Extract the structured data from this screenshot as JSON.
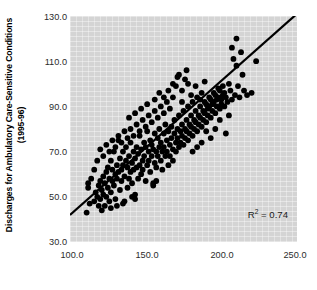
{
  "axes": {
    "ylabel_line1": "Discharges for Ambulatory Care-Sensitive Conditions",
    "ylabel_line2": "(1995-96)",
    "xlabel": "",
    "yticklabels": [
      "130.0",
      "110.0",
      "90.0",
      "70.0",
      "50.0",
      "30.0"
    ],
    "xticklabels": [
      "100.0",
      "150.0",
      "200.0",
      "250.0"
    ]
  },
  "annotation": {
    "r2_prefix": "R",
    "r2_exponent": "2",
    "r2_value": " = 0.74",
    "r2_full": "R2 = 0.74"
  },
  "colors": {
    "plot_background": "#d4d4d4",
    "marker": "#000000",
    "trendline": "#000000",
    "figure_background": "#ffffff",
    "tick_text": "#2b2b2b",
    "axis_title": "#000000"
  },
  "chart_data": {
    "type": "scatter",
    "title": "",
    "xlabel": "",
    "ylabel": "Discharges for Ambulatory Care-Sensitive Conditions (1995-96)",
    "xlim": [
      100.0,
      250.0
    ],
    "ylim": [
      30.0,
      130.0
    ],
    "xticks": [
      100.0,
      150.0,
      200.0,
      250.0
    ],
    "yticks": [
      30.0,
      50.0,
      70.0,
      90.0,
      110.0,
      130.0
    ],
    "grid": false,
    "legend": null,
    "annotations": [
      {
        "text": "R2 = 0.74",
        "x": 232.0,
        "y": 39.0
      }
    ],
    "trendline": {
      "type": "linear",
      "x": [
        100.0,
        250.0
      ],
      "y": [
        42.0,
        131.0
      ],
      "slope": 0.593,
      "intercept": -17.3,
      "r_squared": 0.74
    },
    "marker": {
      "shape": "circle",
      "size": 5,
      "color": "#000000"
    },
    "n_points": 253,
    "points": [
      [
        111,
        43
      ],
      [
        112,
        56
      ],
      [
        113,
        47
      ],
      [
        116,
        48
      ],
      [
        117,
        52
      ],
      [
        118,
        50
      ],
      [
        119,
        46
      ],
      [
        119,
        55
      ],
      [
        120,
        49
      ],
      [
        120,
        57
      ],
      [
        121,
        44
      ],
      [
        121,
        53
      ],
      [
        122,
        51
      ],
      [
        122,
        59
      ],
      [
        123,
        46
      ],
      [
        123,
        56
      ],
      [
        124,
        61
      ],
      [
        124,
        50
      ],
      [
        125,
        54
      ],
      [
        125,
        63
      ],
      [
        126,
        48
      ],
      [
        126,
        58
      ],
      [
        127,
        52
      ],
      [
        127,
        66
      ],
      [
        128,
        57
      ],
      [
        128,
        62
      ],
      [
        129,
        55
      ],
      [
        129,
        70
      ],
      [
        130,
        60
      ],
      [
        130,
        49
      ],
      [
        131,
        64
      ],
      [
        131,
        58
      ],
      [
        132,
        75
      ],
      [
        132,
        61
      ],
      [
        133,
        53
      ],
      [
        133,
        67
      ],
      [
        134,
        62
      ],
      [
        134,
        57
      ],
      [
        135,
        70
      ],
      [
        135,
        64
      ],
      [
        136,
        48
      ],
      [
        136,
        59
      ],
      [
        137,
        66
      ],
      [
        137,
        72
      ],
      [
        138,
        54
      ],
      [
        138,
        63
      ],
      [
        139,
        68
      ],
      [
        139,
        58
      ],
      [
        140,
        61
      ],
      [
        140,
        74
      ],
      [
        141,
        65
      ],
      [
        141,
        56
      ],
      [
        142,
        70
      ],
      [
        142,
        62
      ],
      [
        143,
        49
      ],
      [
        143,
        67
      ],
      [
        144,
        72
      ],
      [
        144,
        63
      ],
      [
        145,
        58
      ],
      [
        145,
        69
      ],
      [
        146,
        64
      ],
      [
        146,
        77
      ],
      [
        147,
        60
      ],
      [
        147,
        71
      ],
      [
        148,
        66
      ],
      [
        148,
        62
      ],
      [
        149,
        74
      ],
      [
        149,
        68
      ],
      [
        150,
        57
      ],
      [
        150,
        72
      ],
      [
        151,
        64
      ],
      [
        151,
        79
      ],
      [
        152,
        70
      ],
      [
        152,
        66
      ],
      [
        153,
        61
      ],
      [
        153,
        75
      ],
      [
        154,
        68
      ],
      [
        154,
        73
      ],
      [
        155,
        55
      ],
      [
        155,
        71
      ],
      [
        156,
        65
      ],
      [
        156,
        78
      ],
      [
        157,
        70
      ],
      [
        157,
        63
      ],
      [
        158,
        76
      ],
      [
        158,
        68
      ],
      [
        159,
        72
      ],
      [
        159,
        80
      ],
      [
        160,
        66
      ],
      [
        160,
        74
      ],
      [
        161,
        70
      ],
      [
        161,
        62
      ],
      [
        162,
        78
      ],
      [
        162,
        72
      ],
      [
        163,
        68
      ],
      [
        163,
        82
      ],
      [
        164,
        75
      ],
      [
        164,
        70
      ],
      [
        165,
        64
      ],
      [
        165,
        79
      ],
      [
        166,
        73
      ],
      [
        166,
        68
      ],
      [
        167,
        81
      ],
      [
        167,
        76
      ],
      [
        168,
        71
      ],
      [
        168,
        66
      ],
      [
        169,
        78
      ],
      [
        169,
        84
      ],
      [
        170,
        74
      ],
      [
        170,
        70
      ],
      [
        171,
        80
      ],
      [
        171,
        76
      ],
      [
        172,
        72
      ],
      [
        172,
        86
      ],
      [
        173,
        79
      ],
      [
        173,
        74
      ],
      [
        174,
        82
      ],
      [
        174,
        77
      ],
      [
        175,
        73
      ],
      [
        175,
        88
      ],
      [
        176,
        80
      ],
      [
        176,
        76
      ],
      [
        177,
        84
      ],
      [
        177,
        79
      ],
      [
        178,
        75
      ],
      [
        178,
        90
      ],
      [
        179,
        82
      ],
      [
        179,
        78
      ],
      [
        180,
        86
      ],
      [
        180,
        81
      ],
      [
        181,
        77
      ],
      [
        181,
        92
      ],
      [
        182,
        84
      ],
      [
        182,
        80
      ],
      [
        183,
        88
      ],
      [
        183,
        83
      ],
      [
        184,
        79
      ],
      [
        184,
        94
      ],
      [
        185,
        86
      ],
      [
        185,
        82
      ],
      [
        186,
        90
      ],
      [
        186,
        85
      ],
      [
        187,
        81
      ],
      [
        187,
        96
      ],
      [
        188,
        88
      ],
      [
        188,
        84
      ],
      [
        189,
        92
      ],
      [
        189,
        87
      ],
      [
        190,
        83
      ],
      [
        190,
        91
      ],
      [
        191,
        89
      ],
      [
        191,
        86
      ],
      [
        192,
        94
      ],
      [
        192,
        90
      ],
      [
        193,
        85
      ],
      [
        193,
        93
      ],
      [
        194,
        91
      ],
      [
        194,
        88
      ],
      [
        195,
        96
      ],
      [
        195,
        92
      ],
      [
        196,
        87
      ],
      [
        196,
        95
      ],
      [
        197,
        93
      ],
      [
        197,
        90
      ],
      [
        198,
        98
      ],
      [
        198,
        94
      ],
      [
        199,
        89
      ],
      [
        199,
        97
      ],
      [
        200,
        93
      ],
      [
        200,
        91
      ],
      [
        201,
        99
      ],
      [
        201,
        95
      ],
      [
        202,
        90
      ],
      [
        202,
        96
      ],
      [
        203,
        94
      ],
      [
        204,
        92
      ],
      [
        205,
        100
      ],
      [
        206,
        97
      ],
      [
        207,
        93
      ],
      [
        208,
        111
      ],
      [
        209,
        95
      ],
      [
        210,
        120
      ],
      [
        210,
        108
      ],
      [
        211,
        99
      ],
      [
        212,
        94
      ],
      [
        213,
        114
      ],
      [
        214,
        104
      ],
      [
        215,
        97
      ],
      [
        217,
        95
      ],
      [
        220,
        96
      ],
      [
        223,
        110
      ],
      [
        207,
        116
      ],
      [
        205,
        86
      ],
      [
        203,
        78
      ],
      [
        199,
        84
      ],
      [
        196,
        80
      ],
      [
        193,
        76
      ],
      [
        190,
        79
      ],
      [
        187,
        74
      ],
      [
        184,
        72
      ],
      [
        181,
        70
      ],
      [
        178,
        100
      ],
      [
        176,
        102
      ],
      [
        174,
        97
      ],
      [
        172,
        104
      ],
      [
        170,
        99
      ],
      [
        168,
        94
      ],
      [
        166,
        89
      ],
      [
        164,
        92
      ],
      [
        162,
        87
      ],
      [
        160,
        90
      ],
      [
        158,
        85
      ],
      [
        156,
        88
      ],
      [
        154,
        83
      ],
      [
        152,
        86
      ],
      [
        150,
        81
      ],
      [
        148,
        84
      ],
      [
        146,
        79
      ],
      [
        144,
        82
      ],
      [
        142,
        77
      ],
      [
        140,
        80
      ],
      [
        138,
        76
      ],
      [
        136,
        79
      ],
      [
        134,
        74
      ],
      [
        132,
        77
      ],
      [
        130,
        72
      ],
      [
        128,
        75
      ],
      [
        126,
        70
      ],
      [
        124,
        73
      ],
      [
        122,
        68
      ],
      [
        120,
        71
      ],
      [
        118,
        66
      ],
      [
        116,
        62
      ],
      [
        114,
        58
      ],
      [
        112,
        54
      ],
      [
        155,
        56
      ],
      [
        157,
        57
      ],
      [
        141,
        50
      ],
      [
        143,
        51
      ],
      [
        135,
        47
      ],
      [
        131,
        46
      ],
      [
        127,
        45
      ],
      [
        162,
        94
      ],
      [
        165,
        97
      ],
      [
        168,
        100
      ],
      [
        171,
        103
      ],
      [
        174,
        92
      ],
      [
        177,
        106
      ],
      [
        180,
        95
      ],
      [
        183,
        99
      ],
      [
        186,
        93
      ],
      [
        189,
        101
      ],
      [
        147,
        89
      ],
      [
        151,
        91
      ],
      [
        143,
        87
      ],
      [
        139,
        85
      ],
      [
        156,
        93
      ],
      [
        159,
        96
      ]
    ]
  }
}
